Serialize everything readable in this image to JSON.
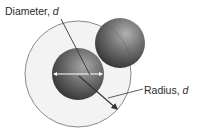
{
  "diagram": {
    "labels": {
      "diameter": {
        "text": "Diameter, ",
        "variable": "d"
      },
      "radius": {
        "text": "Radius, ",
        "variable": "d"
      }
    },
    "shapes": {
      "outer_circle": {
        "cx": 78,
        "cy": 74,
        "r": 53,
        "fill": "#f3f3f3",
        "stroke": "#8a8a8a"
      },
      "central_sphere": {
        "cx": 78,
        "cy": 74,
        "r": 26,
        "color_light": "#9a9a9a",
        "color_dark": "#2e2e2e"
      },
      "neighbor_sphere": {
        "cx": 120,
        "cy": 43,
        "r": 25,
        "color_light": "#a3a3a3",
        "color_dark": "#333333"
      }
    },
    "colors": {
      "diameter_line": "#ffffff",
      "pointer_lines": "#333333"
    }
  }
}
